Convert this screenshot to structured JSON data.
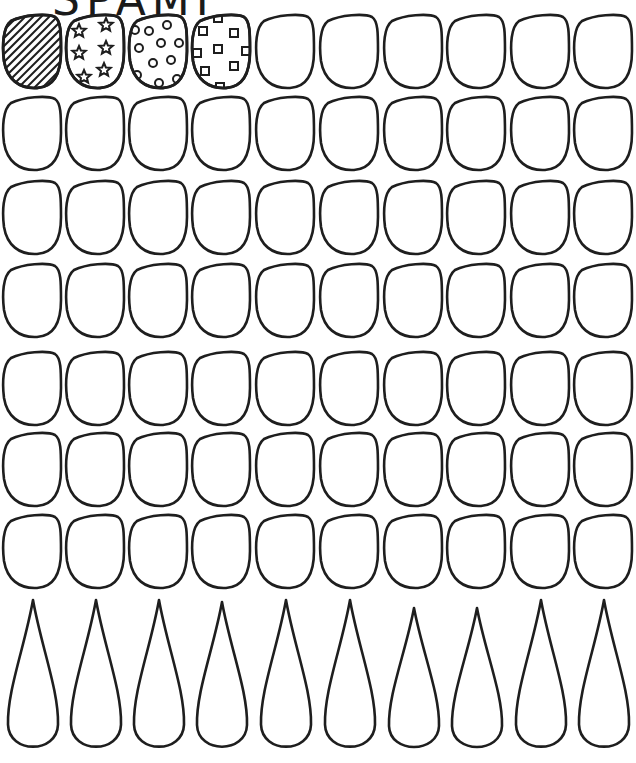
{
  "sheet": {
    "title_partial": "SPAMI",
    "colors": {
      "ink": "#1e1e1e",
      "paper": "#ffffff"
    },
    "grid": {
      "columns": 10,
      "rounded_rows": 7,
      "teardrop_rows": 1,
      "col_x": [
        3,
        66,
        129,
        192,
        256,
        320,
        384,
        447,
        511,
        574
      ],
      "row_y": [
        15,
        97,
        181,
        264,
        352,
        433,
        515
      ],
      "nail_width": 58,
      "nail_height": 73,
      "teardrop_top": 600,
      "teardrop_height": 152
    },
    "examples": [
      {
        "position": 1,
        "pattern": "diagonal-stripes"
      },
      {
        "position": 2,
        "pattern": "stars"
      },
      {
        "position": 3,
        "pattern": "polka-dots"
      },
      {
        "position": 4,
        "pattern": "squares"
      }
    ]
  }
}
